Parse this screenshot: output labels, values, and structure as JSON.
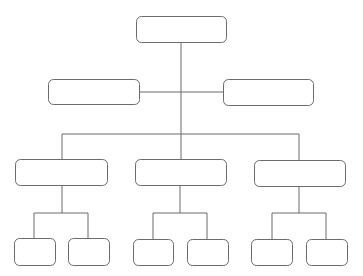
{
  "diagram": {
    "type": "org-chart",
    "style": {
      "stroke": "#6b6b6b",
      "fill": "#ffffff",
      "background": "#ffffff"
    },
    "nodes": [
      {
        "id": "root",
        "label": "",
        "x": 136,
        "y": 16,
        "w": 90,
        "h": 26
      },
      {
        "id": "assistant-left",
        "label": "",
        "x": 48,
        "y": 79,
        "w": 91,
        "h": 25
      },
      {
        "id": "assistant-right",
        "label": "",
        "x": 223,
        "y": 79,
        "w": 90,
        "h": 26
      },
      {
        "id": "dept-1",
        "label": "",
        "x": 15,
        "y": 159,
        "w": 92,
        "h": 26
      },
      {
        "id": "dept-2",
        "label": "",
        "x": 135,
        "y": 159,
        "w": 91,
        "h": 26
      },
      {
        "id": "dept-3",
        "label": "",
        "x": 254,
        "y": 160,
        "w": 91,
        "h": 26
      },
      {
        "id": "team-1a",
        "label": "",
        "x": 14,
        "y": 238,
        "w": 41,
        "h": 27
      },
      {
        "id": "team-1b",
        "label": "",
        "x": 68,
        "y": 238,
        "w": 41,
        "h": 27
      },
      {
        "id": "team-2a",
        "label": "",
        "x": 133,
        "y": 239,
        "w": 40,
        "h": 26
      },
      {
        "id": "team-2b",
        "label": "",
        "x": 187,
        "y": 239,
        "w": 41,
        "h": 26
      },
      {
        "id": "team-3a",
        "label": "",
        "x": 251,
        "y": 239,
        "w": 41,
        "h": 26
      },
      {
        "id": "team-3b",
        "label": "",
        "x": 306,
        "y": 239,
        "w": 41,
        "h": 26
      }
    ]
  }
}
